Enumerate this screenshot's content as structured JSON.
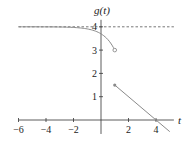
{
  "chart_data": {
    "type": "line",
    "title": "",
    "xlabel": "t",
    "ylabel": "g(t)",
    "xlim": [
      -6,
      5
    ],
    "ylim": [
      -0.6,
      4.4
    ],
    "x_ticks": [
      -6,
      -4,
      -2,
      2,
      4
    ],
    "x_tick_labels": [
      "−6",
      "−4",
      "−2",
      "2",
      "4"
    ],
    "y_ticks": [
      1,
      2,
      3,
      4
    ],
    "y_tick_labels": [
      "1",
      "2",
      "3",
      "4"
    ],
    "grid": false,
    "legend": null,
    "asymptote": {
      "type": "horizontal",
      "y": 4,
      "style": "dashed"
    },
    "series": [
      {
        "name": "left piece (t < 1)",
        "x": [
          -6,
          -4,
          -2,
          -1,
          0,
          0.5,
          1
        ],
        "y": [
          4.0,
          3.99,
          3.95,
          3.88,
          3.7,
          3.45,
          3.0
        ],
        "end_marker": {
          "x": 1,
          "y": 3,
          "style": "open circle"
        }
      },
      {
        "name": "right piece (t >= 1)",
        "x": [
          1,
          4,
          5
        ],
        "y": [
          1.5,
          0,
          -0.5
        ],
        "start_marker": {
          "x": 1,
          "y": 1.5,
          "style": "closed dot"
        }
      }
    ]
  }
}
